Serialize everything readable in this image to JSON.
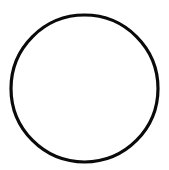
{
  "canvas": {
    "width": 169,
    "height": 170,
    "background": "#ffffff"
  },
  "shape": {
    "type": "circle",
    "cx": 84.5,
    "cy": 88.5,
    "r": 73.5,
    "stroke": "#0a0a0a",
    "stroke_width": 3.2,
    "fill": "none"
  }
}
